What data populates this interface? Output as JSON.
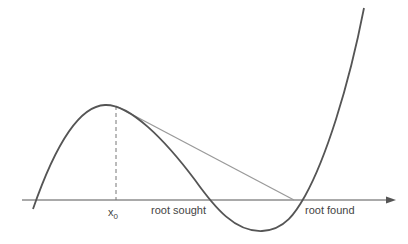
{
  "diagram": {
    "type": "newton-method-illustration",
    "labels": {
      "x0": "x",
      "x0_sub": "0",
      "root_sought": "root sought",
      "root_found": "root found"
    },
    "colors": {
      "curve": "#555555",
      "tangent": "#9a9a9a",
      "axis": "#555555",
      "dashed": "#777777",
      "text": "#444444"
    }
  }
}
